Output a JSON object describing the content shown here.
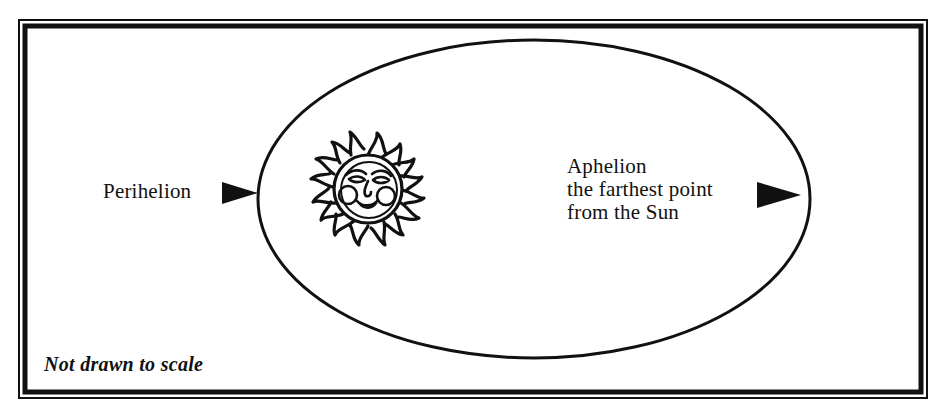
{
  "figure": {
    "background_color": "#ffffff",
    "ink_color": "#111111"
  },
  "frame": {
    "style": "double-rule-border",
    "outer_rect": {
      "x": 18,
      "y": 19,
      "width": 910,
      "height": 380
    },
    "inner_rect": {
      "x": 23,
      "y": 24,
      "width": 900,
      "height": 370
    },
    "outer_stroke_width": 2,
    "inner_stroke_width": 5
  },
  "orbit": {
    "shape": "ellipse",
    "center_x": 534,
    "center_y": 199,
    "radius_x": 276,
    "radius_y": 159,
    "stroke_width": 3,
    "fill": "none"
  },
  "sun": {
    "icon_name": "sun-with-face-icon",
    "center_x": 368,
    "center_y": 189,
    "core_radius": 33,
    "ray_count": 16,
    "description": "decorative sun with smiling face and flame rays"
  },
  "annotations": {
    "perihelion": {
      "label": "Perihelion",
      "text_x": 103,
      "text_y": 179,
      "arrow": {
        "name": "perihelion-arrow",
        "direction": "right",
        "tail_x": 222,
        "tip_x": 258,
        "center_y": 193,
        "half_height": 11
      }
    },
    "aphelion": {
      "lines": [
        "Aphelion",
        "the farthest point",
        "from the Sun"
      ],
      "text_x": 567,
      "text_y": 155,
      "arrow": {
        "name": "aphelion-arrow",
        "direction": "right",
        "tail_x": 757,
        "tip_x": 801,
        "center_y": 195,
        "half_height": 13
      }
    }
  },
  "footnote": {
    "text": "Not drawn to scale",
    "style": "bold-italic",
    "x": 44,
    "y": 353
  }
}
